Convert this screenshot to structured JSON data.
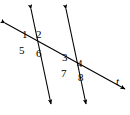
{
  "figure": {
    "type": "geometry-diagram",
    "background_color": "#ffffff",
    "stroke_color": "#000000"
  },
  "lines": [
    {
      "id": "parallel-line-left",
      "name": "first-parallel-line",
      "x1": 31,
      "y1": 9,
      "x2": 51,
      "y2": 104,
      "arrow_start": true,
      "arrow_end": true,
      "label": ""
    },
    {
      "id": "parallel-line-right",
      "name": "second-parallel-line",
      "x1": 66,
      "y1": 9,
      "x2": 86,
      "y2": 104,
      "arrow_start": true,
      "arrow_end": true,
      "label": ""
    },
    {
      "id": "transversal",
      "name": "transversal-line",
      "x1": 5,
      "y1": 23,
      "x2": 125,
      "y2": 89,
      "arrow_start": true,
      "arrow_end": true,
      "label": "t"
    }
  ],
  "intersections": [
    {
      "id": "left-intersection",
      "x": 34,
      "y": 39
    },
    {
      "id": "right-intersection",
      "x": 74,
      "y": 61
    }
  ],
  "angle_labels": [
    {
      "id": "angle-1",
      "text": "1",
      "x": 22,
      "y": 29,
      "position": "upper-left-of-left-intersection"
    },
    {
      "id": "angle-2",
      "text": "2",
      "x": 36,
      "y": 29,
      "position": "upper-right-of-left-intersection"
    },
    {
      "id": "angle-5",
      "text": "5",
      "x": 19,
      "y": 45,
      "position": "lower-left-of-left-intersection"
    },
    {
      "id": "angle-6",
      "text": "6",
      "x": 36,
      "y": 48,
      "position": "lower-right-of-left-intersection"
    },
    {
      "id": "angle-3",
      "text": "3",
      "x": 62,
      "y": 52,
      "position": "upper-left-of-right-intersection"
    },
    {
      "id": "angle-4",
      "text": "4",
      "x": 77,
      "y": 58,
      "position": "upper-right-of-right-intersection"
    },
    {
      "id": "angle-7",
      "text": "7",
      "x": 61,
      "y": 68,
      "position": "lower-left-of-right-intersection"
    },
    {
      "id": "angle-8",
      "text": "8",
      "x": 78,
      "y": 72,
      "position": "lower-right-of-right-intersection"
    }
  ],
  "line_name_labels": [
    {
      "id": "label-t",
      "text": "t",
      "x": 116,
      "y": 76
    }
  ]
}
